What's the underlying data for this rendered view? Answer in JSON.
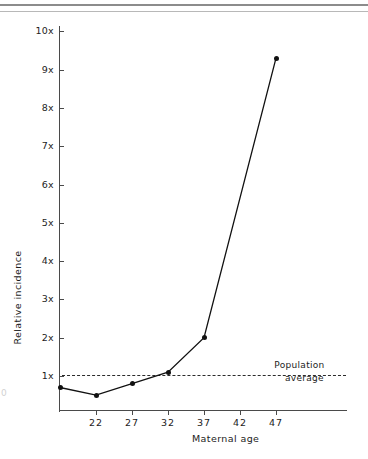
{
  "header": {
    "ghost_text": "",
    "rule_color": "#8c8c8c"
  },
  "left_margin_ghost": "0",
  "chart_data": {
    "type": "line",
    "title": "",
    "subtitle": "",
    "xlabel": "Maternal  age",
    "ylabel": "Relative  incidence",
    "x": [
      17,
      22,
      27,
      32,
      37,
      47
    ],
    "values": [
      0.7,
      0.5,
      0.8,
      1.1,
      2.0,
      9.3
    ],
    "series": [
      {
        "name": "Relative incidence",
        "values": [
          0.7,
          0.5,
          0.8,
          1.1,
          2.0,
          9.3
        ]
      }
    ],
    "xlim": [
      15,
      50
    ],
    "ylim": [
      0,
      10.4
    ],
    "grid": false,
    "legend": "none",
    "marker": "filled-circle",
    "line_color": "#111111",
    "marker_color": "#111111",
    "xticks": [
      22,
      27,
      32,
      37,
      42,
      47
    ],
    "xtick_labels": [
      "22",
      "27",
      "32",
      "37",
      "42",
      "47"
    ],
    "yticks": [
      1,
      2,
      3,
      4,
      5,
      6,
      7,
      8,
      9,
      10
    ],
    "ytick_labels": [
      "1x",
      "2x",
      "3x",
      "4x",
      "5x",
      "6x",
      "7x",
      "8x",
      "9x",
      "10x"
    ],
    "annotations": [
      {
        "name": "population-average",
        "type": "hline",
        "y": 1,
        "style": "dashed",
        "color": "#2b2b2b",
        "label_line1": "Population",
        "label_line2": "average"
      }
    ]
  }
}
